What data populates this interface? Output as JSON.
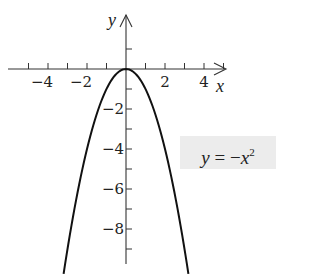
{
  "chart_data": {
    "type": "line",
    "title": "",
    "function": "y = -x^2",
    "xlabel": "x",
    "ylabel": "y",
    "xlim": [
      -6,
      5
    ],
    "ylim": [
      -10,
      2
    ],
    "x_ticks": [
      -5,
      -4,
      -3,
      -2,
      -1,
      1,
      2,
      3,
      4,
      5
    ],
    "x_tick_labels": [
      "−4",
      "−2",
      "2",
      "4"
    ],
    "x_tick_label_values": [
      -4,
      -2,
      2,
      4
    ],
    "y_ticks": [
      1,
      -1,
      -2,
      -3,
      -4,
      -5,
      -6,
      -7,
      -8,
      -9
    ],
    "y_tick_labels": [
      "−2",
      "−4",
      "−6",
      "−8"
    ],
    "y_tick_label_values": [
      -2,
      -4,
      -6,
      -8
    ],
    "grid": false,
    "legend": null,
    "series": [
      {
        "name": "y = −x²",
        "x": [
          -3.2,
          -3,
          -2.5,
          -2,
          -1.5,
          -1,
          -0.5,
          0,
          0.5,
          1,
          1.5,
          2,
          2.5,
          3,
          3.2
        ],
        "y": [
          -10.24,
          -9,
          -6.25,
          -4,
          -2.25,
          -1,
          -0.25,
          0,
          -0.25,
          -1,
          -2.25,
          -4,
          -6.25,
          -9,
          -10.24
        ]
      }
    ],
    "annotations": [
      {
        "text": "y = −x²",
        "position": "right, boxed, near y=−4"
      }
    ]
  },
  "labels": {
    "x_axis": "x",
    "y_axis": "y",
    "equation_y": "y",
    "equation_eq": " = −",
    "equation_x": "x",
    "equation_exp": "2"
  }
}
